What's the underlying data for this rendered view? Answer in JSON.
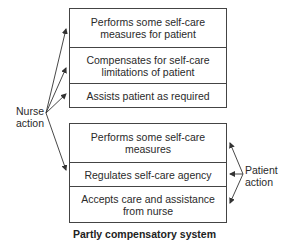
{
  "diagram": {
    "title": "Partly compensatory system",
    "nurse_action": {
      "label": "Nurse action",
      "label_line1": "Nurse",
      "label_line2": "action",
      "items": [
        {
          "line1": "Performs some self-care",
          "line2": "measures for patient"
        },
        {
          "line1": "Compensates for self-care",
          "line2": "limitations of patient"
        },
        {
          "line1": "Assists patient as required",
          "line2": ""
        }
      ]
    },
    "patient_action": {
      "label": "Patient action",
      "label_line1": "Patient",
      "label_line2": "action",
      "items": [
        {
          "line1": "Performs some self-care",
          "line2": "measures"
        },
        {
          "line1": "Regulates self-care agency",
          "line2": ""
        },
        {
          "line1": "Accepts care and assistance",
          "line2": "from nurse"
        }
      ]
    },
    "colors": {
      "line": "#444444",
      "text": "#2a2a2a",
      "background": "#ffffff"
    }
  }
}
